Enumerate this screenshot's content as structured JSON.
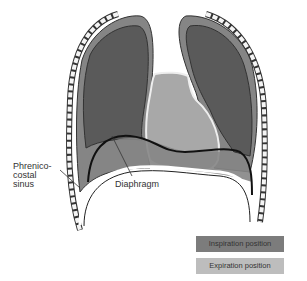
{
  "diagram": {
    "labels": {
      "phrenicocostal_sinus": "Phrenico-\ncostal\nsinus",
      "phrenico_line1": "Phrenico-",
      "phrenico_line2": "costal",
      "phrenico_line3": "sinus",
      "diaphragm": "Diaphragm"
    },
    "legend": [
      {
        "label": "Inspiration position",
        "color": "#7c7c7c"
      },
      {
        "label": "Expiration position",
        "color": "#bdbdbd"
      }
    ],
    "colors": {
      "lung_dark": "#5a5a5a",
      "pleura_mid": "#858585",
      "heart_light": "#a8a8a8",
      "outline": "#1a1a1a",
      "rib_fill": "#f4f4f4"
    }
  }
}
